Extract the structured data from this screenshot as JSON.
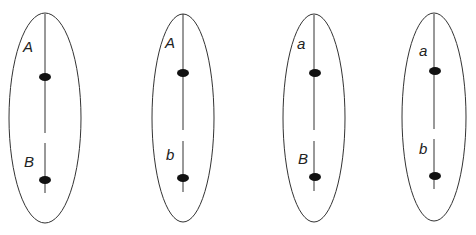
{
  "diagram": {
    "colors": {
      "stroke": "#333333",
      "locus": "#111111",
      "background": "#ffffff"
    },
    "cells": [
      {
        "top_label": "A",
        "bottom_label": "B"
      },
      {
        "top_label": "A",
        "bottom_label": "b"
      },
      {
        "top_label": "a",
        "bottom_label": "B"
      },
      {
        "top_label": "a",
        "bottom_label": "b"
      }
    ]
  }
}
